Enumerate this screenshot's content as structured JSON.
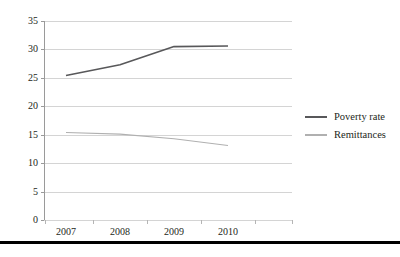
{
  "chart_data": {
    "type": "line",
    "title": "",
    "xlabel": "",
    "ylabel": "",
    "categories": [
      "2007",
      "2008",
      "2009",
      "2010"
    ],
    "x": [
      2007,
      2008,
      2009,
      2010
    ],
    "ylim": [
      0,
      35
    ],
    "yticks": [
      0,
      5,
      10,
      15,
      20,
      25,
      30,
      35
    ],
    "ytick_labels": [
      "0",
      "5",
      "10",
      "15",
      "20",
      "25",
      "30",
      "35"
    ],
    "grid": true,
    "legend_position": "right",
    "series": [
      {
        "name": "Poverty rate",
        "color": "#58585a",
        "values": [
          25.4,
          27.3,
          30.5,
          30.6
        ]
      },
      {
        "name": "Remittances",
        "color": "#b0b0b0",
        "values": [
          15.4,
          15.1,
          14.3,
          13.1
        ]
      }
    ]
  },
  "legend": {
    "items": [
      {
        "label": "Poverty rate",
        "color": "#58585a"
      },
      {
        "label": "Remittances",
        "color": "#b0b0b0"
      }
    ]
  },
  "colors": {
    "grid": "#d4d4d4",
    "axis": "#9a9a9a",
    "text": "#231f20",
    "rule": "#000000",
    "background": "#ffffff"
  }
}
